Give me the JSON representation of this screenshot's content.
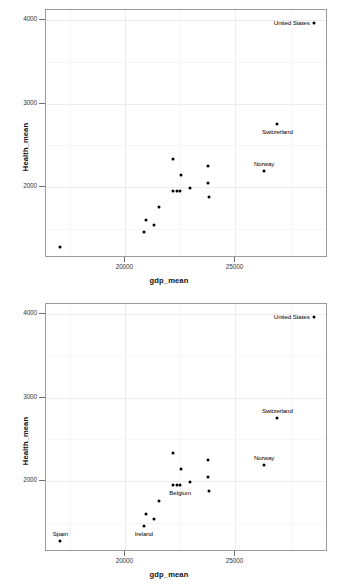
{
  "chart_data": [
    {
      "type": "scatter",
      "title": "",
      "xlabel": "gdp_mean",
      "ylabel": "Health_mean",
      "xlim": [
        16400,
        29200
      ],
      "ylim": [
        1150,
        4120
      ],
      "xticks": [
        20000,
        25000
      ],
      "xticklabels": [
        "20000",
        "25000"
      ],
      "yticks": [
        2000,
        3000,
        4000
      ],
      "yticklabels": [
        "2000",
        "3000",
        "4000"
      ],
      "grid": true,
      "legend": "none",
      "points": [
        {
          "label": "United States",
          "x": 28550,
          "y": 3970,
          "label_pos": "left"
        },
        {
          "label": "Switzerland",
          "x": 26900,
          "y": 2755,
          "label_pos": "below"
        },
        {
          "label": "Norway",
          "x": 26300,
          "y": 2195,
          "label_pos": "above"
        },
        {
          "label": "",
          "x": 22180,
          "y": 2330,
          "label_pos": ""
        },
        {
          "label": "",
          "x": 23750,
          "y": 2250,
          "label_pos": ""
        },
        {
          "label": "",
          "x": 22520,
          "y": 2140,
          "label_pos": ""
        },
        {
          "label": "",
          "x": 23760,
          "y": 2045,
          "label_pos": ""
        },
        {
          "label": "",
          "x": 22950,
          "y": 1985,
          "label_pos": ""
        },
        {
          "label": "",
          "x": 22490,
          "y": 1950,
          "label_pos": ""
        },
        {
          "label": "",
          "x": 22330,
          "y": 1950,
          "label_pos": ""
        },
        {
          "label": "",
          "x": 22180,
          "y": 1950,
          "label_pos": ""
        },
        {
          "label": "",
          "x": 23790,
          "y": 1875,
          "label_pos": ""
        },
        {
          "label": "",
          "x": 21550,
          "y": 1760,
          "label_pos": ""
        },
        {
          "label": "",
          "x": 20960,
          "y": 1600,
          "label_pos": ""
        },
        {
          "label": "",
          "x": 21300,
          "y": 1540,
          "label_pos": ""
        },
        {
          "label": "",
          "x": 20840,
          "y": 1460,
          "label_pos": ""
        },
        {
          "label": "",
          "x": 17050,
          "y": 1280,
          "label_pos": ""
        }
      ]
    },
    {
      "type": "scatter",
      "title": "",
      "xlabel": "gdp_mean",
      "ylabel": "Health_mean",
      "xlim": [
        16400,
        29200
      ],
      "ylim": [
        1150,
        4120
      ],
      "xticks": [
        20000,
        25000
      ],
      "xticklabels": [
        "20000",
        "25000"
      ],
      "yticks": [
        2000,
        3000,
        4000
      ],
      "yticklabels": [
        "2000",
        "3000",
        "4000"
      ],
      "grid": true,
      "legend": "none",
      "points": [
        {
          "label": "United States",
          "x": 28550,
          "y": 3970,
          "label_pos": "left"
        },
        {
          "label": "Switzerland",
          "x": 26900,
          "y": 2755,
          "label_pos": "above"
        },
        {
          "label": "Norway",
          "x": 26300,
          "y": 2195,
          "label_pos": "above"
        },
        {
          "label": "",
          "x": 22180,
          "y": 2330,
          "label_pos": ""
        },
        {
          "label": "",
          "x": 23750,
          "y": 2250,
          "label_pos": ""
        },
        {
          "label": "",
          "x": 22520,
          "y": 2140,
          "label_pos": ""
        },
        {
          "label": "",
          "x": 23760,
          "y": 2045,
          "label_pos": ""
        },
        {
          "label": "",
          "x": 22950,
          "y": 1985,
          "label_pos": ""
        },
        {
          "label": "Belgium",
          "x": 22490,
          "y": 1950,
          "label_pos": "below"
        },
        {
          "label": "",
          "x": 22330,
          "y": 1950,
          "label_pos": ""
        },
        {
          "label": "",
          "x": 22180,
          "y": 1950,
          "label_pos": ""
        },
        {
          "label": "",
          "x": 23790,
          "y": 1875,
          "label_pos": ""
        },
        {
          "label": "",
          "x": 21550,
          "y": 1760,
          "label_pos": ""
        },
        {
          "label": "",
          "x": 20960,
          "y": 1600,
          "label_pos": ""
        },
        {
          "label": "",
          "x": 21300,
          "y": 1540,
          "label_pos": ""
        },
        {
          "label": "Ireland",
          "x": 20840,
          "y": 1460,
          "label_pos": "below"
        },
        {
          "label": "Spain",
          "x": 17050,
          "y": 1280,
          "label_pos": "above"
        }
      ]
    }
  ]
}
